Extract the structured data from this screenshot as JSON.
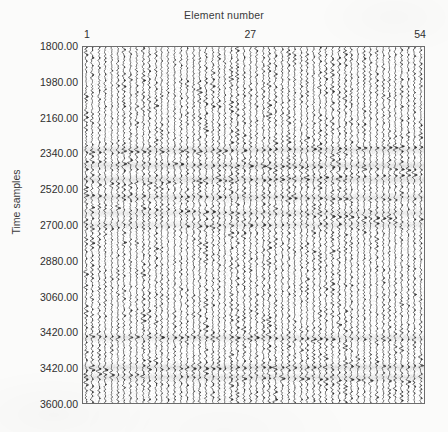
{
  "figure": {
    "x_axis_title": "Element number",
    "y_axis_title": "Time samples"
  },
  "chart_data": {
    "type": "line",
    "title": "",
    "subtitle": "",
    "xlabel": "Element number",
    "ylabel": "Time samples",
    "plot_style": "seismic-wiggle-trace-gather",
    "grid": false,
    "legend": null,
    "xlim": [
      1,
      54
    ],
    "ylim": [
      1800,
      3600
    ],
    "y_axis_direction": "inverted-top-to-bottom",
    "n_traces": 54,
    "x_tick_labels": [
      "1",
      "27",
      "54"
    ],
    "x_tick_values": [
      1,
      27,
      54
    ],
    "y_tick_labels": [
      "1800.00",
      "1980.00",
      "2160.00",
      "2340.00",
      "2520.00",
      "2700.00",
      "2880.00",
      "3060.00",
      "3420.00",
      "3420.00",
      "3600.00"
    ],
    "y_tick_values": [
      1800,
      1980,
      2160,
      2340,
      2520,
      2700,
      2880,
      3060,
      3420,
      3420,
      3600
    ],
    "series_description": "54 vertical oscillating amplitude traces (wiggle display) plotted against time sample index, with strong laterally coherent reflection events.",
    "coherent_events": [
      {
        "time_sample": 2320,
        "strength": 0.85,
        "dip": -0.25
      },
      {
        "time_sample": 2400,
        "strength": 0.95,
        "dip": 0.35
      },
      {
        "time_sample": 2470,
        "strength": 0.9,
        "dip": -0.45
      },
      {
        "time_sample": 2560,
        "strength": 0.8,
        "dip": 0.2
      },
      {
        "time_sample": 2640,
        "strength": 0.75,
        "dip": 0.55
      },
      {
        "time_sample": 2700,
        "strength": 0.7,
        "dip": -0.3
      },
      {
        "time_sample": 3270,
        "strength": 0.8,
        "dip": 0.15
      },
      {
        "time_sample": 3420,
        "strength": 0.95,
        "dip": -0.2
      },
      {
        "time_sample": 3470,
        "strength": 0.85,
        "dip": 0.3
      }
    ],
    "colors": {
      "trace": "#2a2a2a",
      "axis": "#6d6d6d",
      "background": "#ffffff",
      "page": "#fbfbfa"
    }
  }
}
